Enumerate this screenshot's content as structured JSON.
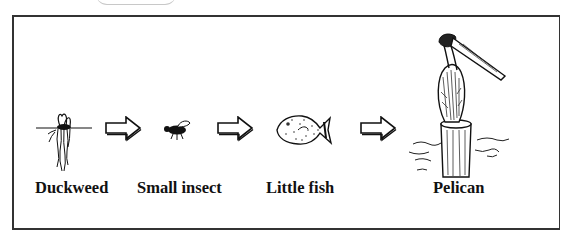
{
  "diagram": {
    "type": "food-chain",
    "nodes": [
      {
        "id": "duckweed",
        "label": "Duckweed",
        "icon": "duckweed-plant-icon"
      },
      {
        "id": "small-insect",
        "label": "Small insect",
        "icon": "insect-icon"
      },
      {
        "id": "little-fish",
        "label": "Little fish",
        "icon": "fish-icon"
      },
      {
        "id": "pelican",
        "label": "Pelican",
        "icon": "pelican-icon"
      }
    ],
    "edges": [
      {
        "from": "duckweed",
        "to": "small-insect",
        "icon": "arrow-right-icon"
      },
      {
        "from": "small-insect",
        "to": "little-fish",
        "icon": "arrow-right-icon"
      },
      {
        "from": "little-fish",
        "to": "pelican",
        "icon": "arrow-right-icon"
      }
    ],
    "colors": {
      "stroke": "#111111",
      "frame": "#333333",
      "background": "#ffffff"
    }
  }
}
